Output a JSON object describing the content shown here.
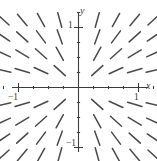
{
  "figure": {
    "kind": "slope-field-plot",
    "background_color": "#ffffff",
    "ink_color": "#4a4a4a",
    "axis_color": "#3d3d3d"
  },
  "axes": {
    "x_axis_label": "x",
    "y_axis_label": "y",
    "x_tick_labels": [
      "−1",
      "1"
    ],
    "y_tick_labels": [
      "1",
      "−1"
    ],
    "x_label_neg1": "−1",
    "x_label_pos1": "1",
    "y_label_pos1": "1",
    "y_label_neg1": "−1"
  },
  "chart_data": {
    "type": "scatter",
    "subtype": "slope-field",
    "title": "",
    "xlabel": "x",
    "ylabel": "y",
    "xlim": [
      -1.45,
      1.3
    ],
    "ylim": [
      -1.35,
      1.4
    ],
    "grid": false,
    "legend": null,
    "xticks": [
      -1,
      1
    ],
    "yticks": [
      -1,
      1
    ],
    "xtick_labels": [
      "−1",
      "1"
    ],
    "ytick_labels": [
      "1",
      "−1"
    ],
    "minor_tick_spacing": 0.25,
    "slope_rule": "dy/dx = y / x",
    "segment_grid_x": [
      -1.25,
      -0.9375,
      -0.625,
      -0.3125,
      0.3125,
      0.625,
      0.9375,
      1.25
    ],
    "segment_grid_y": [
      1.125,
      0.84375,
      0.5625,
      0.28125,
      -0.28125,
      -0.5625,
      -0.84375,
      -1.125
    ],
    "segment_length_px": 15,
    "segments_description": "Short line segments on an 8x8 grid omitting the axes; slope at each point equals y/x so segments point radially away from the origin, steep near the y-axis and shallow near the x-axis.",
    "quadrant_slope_signs": {
      "quadrant_I": "positive",
      "quadrant_II": "negative",
      "quadrant_III": "positive",
      "quadrant_IV": "negative"
    }
  }
}
